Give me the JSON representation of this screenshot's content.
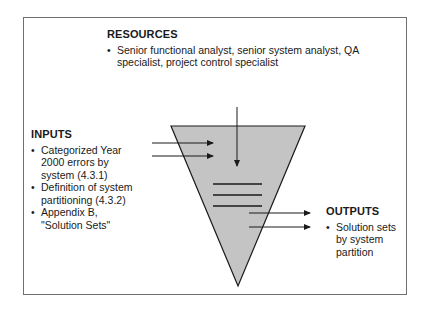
{
  "diagram": {
    "type": "funnel-process",
    "colors": {
      "funnel_fill": "#c4c4c4",
      "stroke": "#1a1a1a",
      "frame": "#707070"
    },
    "resources": {
      "heading": "RESOURCES",
      "items": [
        "Senior functional analyst, senior system analyst, QA specialist, project control specialist"
      ]
    },
    "inputs": {
      "heading": "INPUTS",
      "items": [
        "Categorized Year 2000 errors by system (4.3.1)",
        "Definition of system partitioning (4.3.2)",
        "Appendix B, \"Solution Sets\""
      ]
    },
    "outputs": {
      "heading": "OUTPUTS",
      "items": [
        "Solution sets by system partition"
      ]
    }
  }
}
